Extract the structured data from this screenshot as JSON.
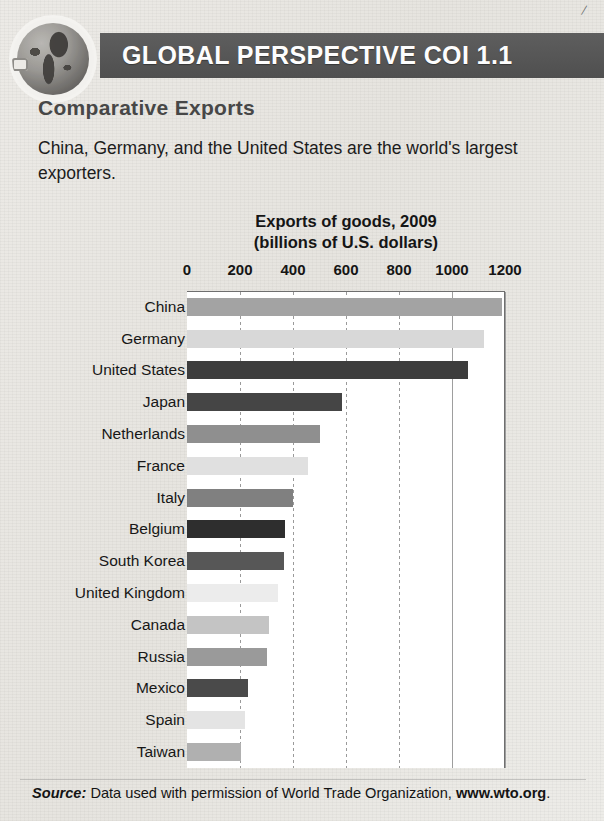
{
  "page": {
    "corner_mark": "/"
  },
  "header": {
    "banner_title": "GLOBAL PERSPECTIVE COI 1.1",
    "globe_icon": "globe-icon",
    "banner_color": "#565656"
  },
  "body": {
    "heading": "Comparative Exports",
    "description": "China, Germany, and the United States are the world's largest exporters."
  },
  "footer": {
    "source_label": "Source:",
    "source_text": " Data used with permission of World Trade Organization, ",
    "source_url": "www.wto.org",
    "source_period": "."
  },
  "chart_data": {
    "type": "bar",
    "orientation": "horizontal",
    "title": "Exports of goods, 2009",
    "subtitle": "(billions of U.S. dollars)",
    "xlabel": "",
    "ylabel": "",
    "xlim": [
      0,
      1200
    ],
    "xticks": [
      0,
      200,
      400,
      600,
      800,
      1000,
      1200
    ],
    "xtick_labels": [
      "0",
      "200",
      "400",
      "600",
      "800",
      "1000",
      "1200"
    ],
    "grid": true,
    "legend": "none",
    "categories": [
      "China",
      "Germany",
      "United States",
      "Japan",
      "Netherlands",
      "France",
      "Italy",
      "Belgium",
      "South Korea",
      "United Kingdom",
      "Canada",
      "Russia",
      "Mexico",
      "Spain",
      "Taiwan"
    ],
    "values": [
      1190,
      1120,
      1060,
      585,
      500,
      455,
      400,
      370,
      365,
      345,
      310,
      300,
      230,
      220,
      205
    ],
    "bar_colors": [
      "#a3a3a3",
      "#d8d8d8",
      "#3d3d3d",
      "#454545",
      "#8f8f8f",
      "#e0e0e0",
      "#808080",
      "#2e2e2e",
      "#575757",
      "#ececec",
      "#c4c4c4",
      "#9a9a9a",
      "#4a4a4a",
      "#e4e4e4",
      "#b0b0b0"
    ]
  }
}
